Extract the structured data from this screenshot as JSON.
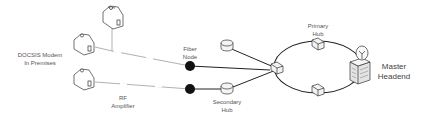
{
  "diagram": {
    "title": "",
    "labels": {
      "docsis_modem": [
        "DOCSIS Modem",
        "In Premises"
      ],
      "fiber_node": [
        "Fiber",
        "Node"
      ],
      "rf_amplifier": [
        "RF",
        "Amplifier"
      ],
      "secondary_hub": [
        "Secondary",
        "Hub"
      ],
      "primary_hub": [
        "Primary",
        "Hub"
      ],
      "master_headend": [
        "Master",
        "Headend"
      ]
    },
    "nodes": [
      {
        "id": "house-1",
        "type": "house",
        "label": "DOCSIS Modem In Premises"
      },
      {
        "id": "house-2",
        "type": "house",
        "label": "DOCSIS Modem In Premises"
      },
      {
        "id": "house-3",
        "type": "house",
        "label": "DOCSIS Modem In Premises"
      },
      {
        "id": "rf-amp-1",
        "type": "rf-amplifier"
      },
      {
        "id": "rf-amp-2",
        "type": "rf-amplifier"
      },
      {
        "id": "fiber-node-1",
        "type": "fiber-node",
        "label": "Fiber Node"
      },
      {
        "id": "fiber-node-2",
        "type": "fiber-node"
      },
      {
        "id": "secondary-hub-1",
        "type": "secondary-hub"
      },
      {
        "id": "secondary-hub-2",
        "type": "secondary-hub",
        "label": "Secondary Hub"
      },
      {
        "id": "primary-hub-west",
        "type": "primary-hub"
      },
      {
        "id": "primary-hub-north",
        "type": "primary-hub",
        "label": "Primary Hub"
      },
      {
        "id": "primary-hub-south",
        "type": "primary-hub"
      },
      {
        "id": "master-headend",
        "type": "headend",
        "label": "Master Headend"
      }
    ],
    "edges": [
      [
        "house-1",
        "house-2-junction"
      ],
      [
        "house-2",
        "rf-amp-1"
      ],
      [
        "rf-amp-1",
        "fiber-node-1"
      ],
      [
        "house-3",
        "rf-amp-2"
      ],
      [
        "rf-amp-2",
        "fiber-node-2"
      ],
      [
        "fiber-node-1",
        "primary-hub-west"
      ],
      [
        "fiber-node-2",
        "secondary-hub-2"
      ],
      [
        "secondary-hub-1",
        "primary-hub-west"
      ],
      [
        "secondary-hub-2",
        "primary-hub-west"
      ],
      [
        "primary-hub-west",
        "primary-hub-north"
      ],
      [
        "primary-hub-north",
        "master-headend"
      ],
      [
        "master-headend",
        "primary-hub-south"
      ],
      [
        "primary-hub-south",
        "primary-hub-west"
      ]
    ],
    "colors": {
      "line": "#222222",
      "coax_line": "#9a9a9a",
      "node_fill": "#111111",
      "device_fill": "#f2f2f2",
      "text": "#555555"
    }
  }
}
